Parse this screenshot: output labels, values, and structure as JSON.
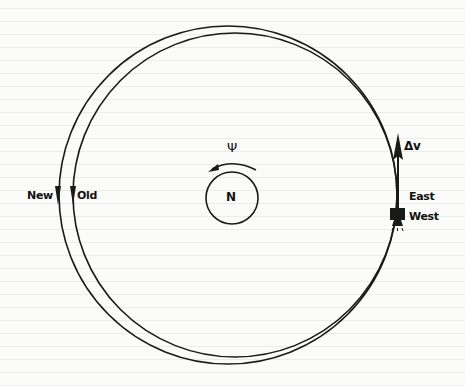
{
  "diagram": {
    "type": "orbit-change-illustration",
    "colors": {
      "ink": "#1a1a1a",
      "background": "#fbfbf9"
    },
    "orbits": {
      "new": {
        "label": "New",
        "cx": 228,
        "cy": 195,
        "r": 169
      },
      "old": {
        "label": "Old",
        "cx": 235,
        "cy": 195,
        "r": 162
      }
    },
    "earth": {
      "label": "N",
      "cx": 232,
      "cy": 198,
      "r": 26
    },
    "rotation": {
      "symbol": "Ψ",
      "direction": "counterclockwise"
    },
    "satellite": {
      "thrust_label": "Δv",
      "east_label": "East",
      "west_label": "West"
    }
  }
}
